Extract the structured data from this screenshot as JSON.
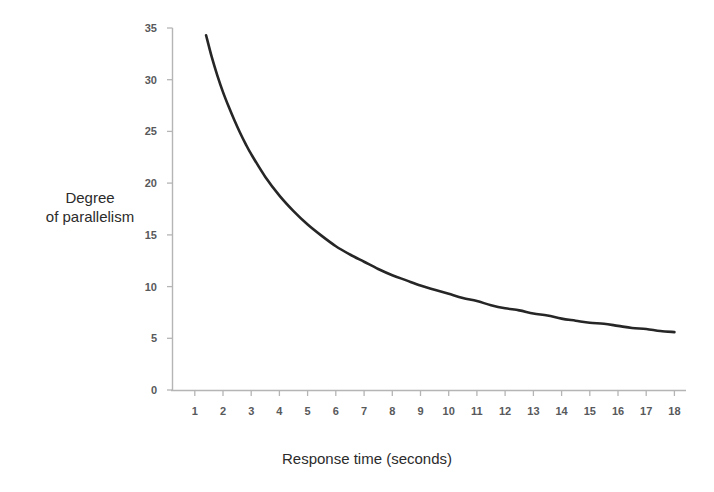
{
  "chart_data": {
    "type": "line",
    "title": "",
    "xlabel": "Response time (seconds)",
    "ylabel_line1": "Degree",
    "ylabel_line2": "of parallelism",
    "ylabel": "Degree of parallelism",
    "xlim": [
      0.6,
      18.6
    ],
    "ylim": [
      0,
      35
    ],
    "xticks": [
      1,
      2,
      3,
      4,
      5,
      6,
      7,
      8,
      9,
      10,
      11,
      12,
      13,
      14,
      15,
      16,
      17,
      18
    ],
    "yticks": [
      0,
      5,
      10,
      15,
      20,
      25,
      30,
      35
    ],
    "xtick_labels": [
      "1",
      "2",
      "3",
      "4",
      "5",
      "6",
      "7",
      "8",
      "9",
      "10",
      "11",
      "12",
      "13",
      "14",
      "15",
      "16",
      "17",
      "18"
    ],
    "ytick_labels": [
      "0",
      "5",
      "10",
      "15",
      "20",
      "25",
      "30",
      "35"
    ],
    "grid": false,
    "legend": false,
    "series": [
      {
        "name": "Degree of parallelism vs response time",
        "color": "#262626",
        "x": [
          1.4,
          1.6,
          1.8,
          2.0,
          2.2,
          2.4,
          2.6,
          2.8,
          3.0,
          3.5,
          4.0,
          4.5,
          5.0,
          5.5,
          6.0,
          6.5,
          7.0,
          7.5,
          8.0,
          8.5,
          9.0,
          9.5,
          10.0,
          10.5,
          11.0,
          11.5,
          12.0,
          12.5,
          13.0,
          13.5,
          14.0,
          14.5,
          15.0,
          15.5,
          16.0,
          16.5,
          17.0,
          17.5,
          18.0
        ],
        "y": [
          34.3,
          32.2,
          30.4,
          28.8,
          27.4,
          26.1,
          24.9,
          23.8,
          22.8,
          20.6,
          18.8,
          17.3,
          16.0,
          14.9,
          13.9,
          13.1,
          12.4,
          11.7,
          11.1,
          10.6,
          10.1,
          9.7,
          9.3,
          8.9,
          8.6,
          8.2,
          7.9,
          7.7,
          7.4,
          7.2,
          6.9,
          6.7,
          6.5,
          6.4,
          6.2,
          6.0,
          5.9,
          5.7,
          5.6
        ]
      }
    ],
    "axis_color": "#b5b5b5",
    "curve_color": "#262626"
  }
}
